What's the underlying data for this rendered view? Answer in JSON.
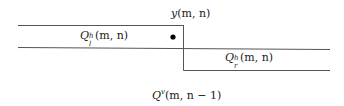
{
  "diagram": {
    "labels": {
      "y": {
        "base": "y",
        "args": "(m, n)"
      },
      "q_left": {
        "base": "Q",
        "sup": "h",
        "sub": "l",
        "args": "(m, n)"
      },
      "q_right": {
        "base": "Q",
        "sup": "h",
        "sub": "r",
        "args": "(m, n)"
      },
      "q_vertical": {
        "base": "Q",
        "sup": "v",
        "args": "(m, n − 1)"
      }
    },
    "colors": {
      "line": "#555555",
      "dot": "#000000",
      "background": "#ffffff"
    }
  }
}
